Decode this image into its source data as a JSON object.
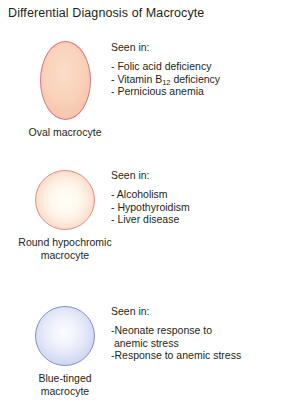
{
  "figure": {
    "title": "Differential Diagnosis of Macrocyte"
  },
  "entries": [
    {
      "cell_name": "oval-macrocyte",
      "caption_lines": [
        "Oval macrocyte"
      ],
      "shape": "oval",
      "fill_color": "#f9d3bc",
      "border_color": "#d9737c",
      "heading": "Seen in:",
      "findings": [
        {
          "prefix": "- ",
          "text": "Folic acid deficiency"
        },
        {
          "prefix": "- ",
          "text_before_sub": "Vitamin B",
          "subscript": "12",
          "text_after_sub": " deficiency"
        },
        {
          "prefix": "- ",
          "text": "Pernicious anemia"
        }
      ]
    },
    {
      "cell_name": "round-hypochromic-macrocyte",
      "caption_lines": [
        "Round hypochromic",
        "macrocyte"
      ],
      "shape": "circle",
      "fill_color": "#fdeee0",
      "border_color": "#e58a86",
      "heading": "Seen in:",
      "findings": [
        {
          "prefix": "- ",
          "text": "Alcoholism"
        },
        {
          "prefix": "- ",
          "text": "Hypothyroidism"
        },
        {
          "prefix": "- ",
          "text": "Liver disease"
        }
      ]
    },
    {
      "cell_name": "blue-tinged-macrocyte",
      "caption_lines": [
        "Blue-tinged",
        "macrocyte"
      ],
      "shape": "circle",
      "fill_color": "#e2e7f8",
      "border_color": "#7e92c8",
      "heading": "Seen in:",
      "findings": [
        {
          "prefix": "-",
          "text": "Neonate response to\n anemic stress"
        },
        {
          "prefix": "-",
          "text": "Response to anemic stress"
        }
      ]
    }
  ]
}
